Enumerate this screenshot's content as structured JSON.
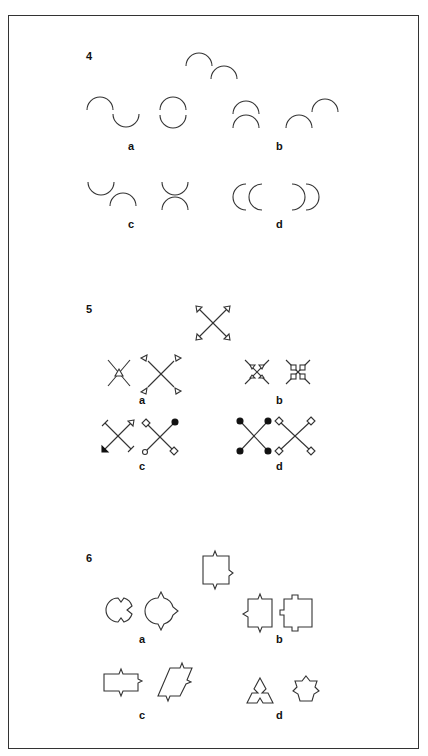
{
  "page": {
    "type": "visual-analogy-puzzle-sheet",
    "problems": [
      {
        "number": "4",
        "stem": "two-upward-arcs-offset-diagonal",
        "options": [
          {
            "label": "a",
            "figures": [
              "arc-up-then-arc-down-wave",
              "two-arcs-forming-circle"
            ]
          },
          {
            "label": "b",
            "figures": [
              "two-stacked-upward-arcs",
              "two-upward-arcs-offset-diagonal-rising"
            ]
          },
          {
            "label": "c",
            "figures": [
              "downward-arc-then-upward-arc",
              "downward-arc-over-upward-arc-x"
            ]
          },
          {
            "label": "d",
            "figures": [
              "two-left-facing-arcs",
              "two-right-facing-arcs"
            ]
          }
        ]
      },
      {
        "number": "5",
        "stem": "x-with-outward-triangle-arrowheads",
        "options": [
          {
            "label": "a",
            "figures": [
              "x-with-center-triangle",
              "x-with-detached-triangles"
            ]
          },
          {
            "label": "b",
            "figures": [
              "x-with-inward-triangles",
              "x-with-inward-squares"
            ]
          },
          {
            "label": "c",
            "figures": [
              "x-with-mixed-terminals",
              "x-with-diamonds-circle-dot"
            ]
          },
          {
            "label": "d",
            "figures": [
              "x-with-filled-dots",
              "x-with-hollow-diamonds"
            ]
          }
        ]
      },
      {
        "number": "6",
        "stem": "square-with-pointed-notches",
        "options": [
          {
            "label": "a",
            "figures": [
              "circle-with-notches",
              "circle-with-points"
            ]
          },
          {
            "label": "b",
            "figures": [
              "square-with-points-left",
              "square-with-square-tabs"
            ]
          },
          {
            "label": "c",
            "figures": [
              "rectangle-with-points",
              "parallelogram-with-points"
            ]
          },
          {
            "label": "d",
            "figures": [
              "triangle-with-notches",
              "pentagon-flower"
            ]
          }
        ]
      }
    ]
  },
  "labels": {
    "p4": "4",
    "p5": "5",
    "p6": "6",
    "a": "a",
    "b": "b",
    "c": "c",
    "d": "d"
  },
  "colors": {
    "ink": "#333333",
    "background": "#ffffff",
    "frame": "#333333"
  }
}
